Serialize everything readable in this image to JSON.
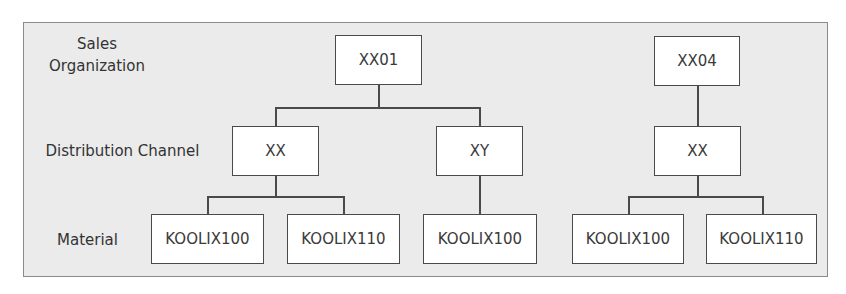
{
  "levels": {
    "sales_org": "Sales Organization",
    "sales_org_line1": "Sales",
    "sales_org_line2": "Organization",
    "distribution_channel": "Distribution Channel",
    "material": "Material"
  },
  "tree": [
    {
      "sales_org": "XX01",
      "channels": [
        {
          "channel": "XX",
          "materials": [
            "KOOLIX100",
            "KOOLIX110"
          ]
        },
        {
          "channel": "XY",
          "materials": [
            "KOOLIX100"
          ]
        }
      ]
    },
    {
      "sales_org": "XX04",
      "channels": [
        {
          "channel": "XX",
          "materials": [
            "KOOLIX100",
            "KOOLIX110"
          ]
        }
      ]
    }
  ],
  "colors": {
    "background": "#ebebeb",
    "box_fill": "#ffffff",
    "box_border": "#4a4a4a",
    "text": "#333333"
  }
}
